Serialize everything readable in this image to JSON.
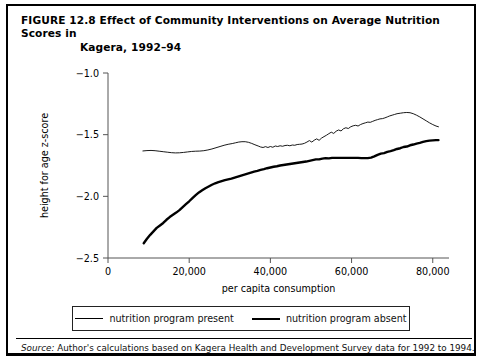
{
  "figure": {
    "label": "FIGURE 12.8",
    "title_line1": "Effect of Community Interventions on Average Nutrition Scores in",
    "title_line2": "Kagera, 1992–94"
  },
  "legend": {
    "items": [
      {
        "label": "nutrition program present",
        "style": "thin"
      },
      {
        "label": "nutrition program absent",
        "style": "thick"
      }
    ]
  },
  "source": {
    "prefix": "Source:",
    "text": " Author's calculations based on Kagera Health and Development Survey data for 1992 to 1994."
  },
  "colors": {
    "ink": "#000000",
    "axis": "#555555",
    "background": "#ffffff"
  },
  "chart_data": {
    "type": "line",
    "title": "Effect of Community Interventions on Average Nutrition Scores in Kagera, 1992–94",
    "xlabel": "per capita consumption",
    "ylabel": "height for age z-score",
    "xlim": [
      0,
      84000
    ],
    "ylim": [
      -2.5,
      -1.0
    ],
    "xticks": [
      0,
      20000,
      40000,
      60000,
      80000
    ],
    "xticklabels": [
      "0",
      "20,000",
      "40,000",
      "60,000",
      "80,000"
    ],
    "yticks": [
      -1.0,
      -1.5,
      -2.0,
      -2.5
    ],
    "yticklabels": [
      "−1.0",
      "−1.5",
      "−2.0",
      "−2.5"
    ],
    "grid": false,
    "legend_position": "below",
    "series": [
      {
        "name": "nutrition program present",
        "style": "thin",
        "width": 0.9,
        "points": [
          [
            8600,
            -1.632
          ],
          [
            9600,
            -1.629
          ],
          [
            10600,
            -1.628
          ],
          [
            11600,
            -1.63
          ],
          [
            12600,
            -1.634
          ],
          [
            13600,
            -1.638
          ],
          [
            14600,
            -1.642
          ],
          [
            15600,
            -1.646
          ],
          [
            16600,
            -1.648
          ],
          [
            17600,
            -1.647
          ],
          [
            18600,
            -1.644
          ],
          [
            19600,
            -1.64
          ],
          [
            20600,
            -1.636
          ],
          [
            21600,
            -1.634
          ],
          [
            22600,
            -1.633
          ],
          [
            23600,
            -1.63
          ],
          [
            24600,
            -1.624
          ],
          [
            25600,
            -1.616
          ],
          [
            26600,
            -1.606
          ],
          [
            27600,
            -1.596
          ],
          [
            28600,
            -1.586
          ],
          [
            29600,
            -1.578
          ],
          [
            30600,
            -1.572
          ],
          [
            31400,
            -1.566
          ],
          [
            32200,
            -1.56
          ],
          [
            33000,
            -1.557
          ],
          [
            33800,
            -1.557
          ],
          [
            34600,
            -1.562
          ],
          [
            35400,
            -1.571
          ],
          [
            36200,
            -1.582
          ],
          [
            37000,
            -1.592
          ],
          [
            37600,
            -1.6
          ],
          [
            38200,
            -1.604
          ],
          [
            38800,
            -1.597
          ],
          [
            39400,
            -1.604
          ],
          [
            40000,
            -1.596
          ],
          [
            40600,
            -1.602
          ],
          [
            41200,
            -1.592
          ],
          [
            41800,
            -1.596
          ],
          [
            42400,
            -1.59
          ],
          [
            43000,
            -1.594
          ],
          [
            43600,
            -1.588
          ],
          [
            44200,
            -1.586
          ],
          [
            44800,
            -1.59
          ],
          [
            45400,
            -1.584
          ],
          [
            46000,
            -1.586
          ],
          [
            46600,
            -1.58
          ],
          [
            47200,
            -1.578
          ],
          [
            47800,
            -1.576
          ],
          [
            48400,
            -1.57
          ],
          [
            49000,
            -1.56
          ],
          [
            49600,
            -1.548
          ],
          [
            50200,
            -1.56
          ],
          [
            50800,
            -1.545
          ],
          [
            51400,
            -1.534
          ],
          [
            52000,
            -1.546
          ],
          [
            52600,
            -1.528
          ],
          [
            53200,
            -1.516
          ],
          [
            53800,
            -1.505
          ],
          [
            54400,
            -1.492
          ],
          [
            55000,
            -1.48
          ],
          [
            55600,
            -1.49
          ],
          [
            56200,
            -1.472
          ],
          [
            56800,
            -1.462
          ],
          [
            57400,
            -1.47
          ],
          [
            58000,
            -1.452
          ],
          [
            58600,
            -1.444
          ],
          [
            59200,
            -1.45
          ],
          [
            59800,
            -1.436
          ],
          [
            60400,
            -1.428
          ],
          [
            61000,
            -1.424
          ],
          [
            61600,
            -1.43
          ],
          [
            62200,
            -1.418
          ],
          [
            62800,
            -1.41
          ],
          [
            63400,
            -1.404
          ],
          [
            64000,
            -1.398
          ],
          [
            64600,
            -1.4
          ],
          [
            65200,
            -1.392
          ],
          [
            65800,
            -1.384
          ],
          [
            66400,
            -1.378
          ],
          [
            67000,
            -1.372
          ],
          [
            67600,
            -1.37
          ],
          [
            68200,
            -1.364
          ],
          [
            68800,
            -1.356
          ],
          [
            69400,
            -1.348
          ],
          [
            70000,
            -1.342
          ],
          [
            70600,
            -1.336
          ],
          [
            71200,
            -1.33
          ],
          [
            72000,
            -1.326
          ],
          [
            72800,
            -1.322
          ],
          [
            73600,
            -1.32
          ],
          [
            74400,
            -1.322
          ],
          [
            75200,
            -1.33
          ],
          [
            76000,
            -1.342
          ],
          [
            76800,
            -1.356
          ],
          [
            77600,
            -1.372
          ],
          [
            78400,
            -1.388
          ],
          [
            79200,
            -1.404
          ],
          [
            80000,
            -1.418
          ],
          [
            80800,
            -1.43
          ],
          [
            81400,
            -1.436
          ]
        ]
      },
      {
        "name": "nutrition program absent",
        "style": "thick",
        "width": 2.4,
        "points": [
          [
            8800,
            -2.38
          ],
          [
            9600,
            -2.344
          ],
          [
            10400,
            -2.312
          ],
          [
            11200,
            -2.284
          ],
          [
            12000,
            -2.256
          ],
          [
            12800,
            -2.236
          ],
          [
            13600,
            -2.216
          ],
          [
            14400,
            -2.19
          ],
          [
            15200,
            -2.168
          ],
          [
            16000,
            -2.15
          ],
          [
            16800,
            -2.132
          ],
          [
            17600,
            -2.112
          ],
          [
            18400,
            -2.088
          ],
          [
            19200,
            -2.064
          ],
          [
            20000,
            -2.04
          ],
          [
            20800,
            -2.014
          ],
          [
            21600,
            -1.99
          ],
          [
            22400,
            -1.968
          ],
          [
            23200,
            -1.95
          ],
          [
            24000,
            -1.934
          ],
          [
            24800,
            -1.92
          ],
          [
            25600,
            -1.906
          ],
          [
            26400,
            -1.894
          ],
          [
            27200,
            -1.884
          ],
          [
            28000,
            -1.876
          ],
          [
            28800,
            -1.868
          ],
          [
            29600,
            -1.862
          ],
          [
            30400,
            -1.856
          ],
          [
            31200,
            -1.848
          ],
          [
            32000,
            -1.84
          ],
          [
            32800,
            -1.832
          ],
          [
            33600,
            -1.824
          ],
          [
            34400,
            -1.816
          ],
          [
            35200,
            -1.808
          ],
          [
            36000,
            -1.8
          ],
          [
            36800,
            -1.794
          ],
          [
            37600,
            -1.786
          ],
          [
            38400,
            -1.78
          ],
          [
            39200,
            -1.772
          ],
          [
            40000,
            -1.766
          ],
          [
            40800,
            -1.76
          ],
          [
            41600,
            -1.756
          ],
          [
            42400,
            -1.75
          ],
          [
            43200,
            -1.746
          ],
          [
            44000,
            -1.742
          ],
          [
            44800,
            -1.738
          ],
          [
            45600,
            -1.734
          ],
          [
            46400,
            -1.73
          ],
          [
            47200,
            -1.726
          ],
          [
            48000,
            -1.722
          ],
          [
            48800,
            -1.718
          ],
          [
            49600,
            -1.712
          ],
          [
            50400,
            -1.706
          ],
          [
            51200,
            -1.7
          ],
          [
            52000,
            -1.7
          ],
          [
            52800,
            -1.694
          ],
          [
            53600,
            -1.69
          ],
          [
            54400,
            -1.692
          ],
          [
            55200,
            -1.688
          ],
          [
            56000,
            -1.688
          ],
          [
            56800,
            -1.688
          ],
          [
            57600,
            -1.688
          ],
          [
            58400,
            -1.688
          ],
          [
            59200,
            -1.688
          ],
          [
            60000,
            -1.688
          ],
          [
            60800,
            -1.688
          ],
          [
            61600,
            -1.688
          ],
          [
            62400,
            -1.69
          ],
          [
            63200,
            -1.69
          ],
          [
            64000,
            -1.69
          ],
          [
            64800,
            -1.686
          ],
          [
            65600,
            -1.676
          ],
          [
            66400,
            -1.664
          ],
          [
            67200,
            -1.654
          ],
          [
            68000,
            -1.65
          ],
          [
            68800,
            -1.64
          ],
          [
            69600,
            -1.634
          ],
          [
            70400,
            -1.626
          ],
          [
            71200,
            -1.616
          ],
          [
            72000,
            -1.61
          ],
          [
            72800,
            -1.6
          ],
          [
            73600,
            -1.596
          ],
          [
            74400,
            -1.586
          ],
          [
            75200,
            -1.58
          ],
          [
            76000,
            -1.572
          ],
          [
            76800,
            -1.566
          ],
          [
            77600,
            -1.558
          ],
          [
            78400,
            -1.552
          ],
          [
            79200,
            -1.548
          ],
          [
            80000,
            -1.546
          ],
          [
            80800,
            -1.544
          ],
          [
            81400,
            -1.544
          ]
        ]
      }
    ]
  }
}
